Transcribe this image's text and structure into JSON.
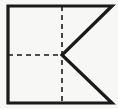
{
  "figure": {
    "type": "line-drawing",
    "canvas": {
      "width": 118,
      "height": 109
    },
    "background_color": "#f7f7f5",
    "stroke_color": "#1a1a1a",
    "dash_color": "#1a1a1a",
    "solid_stroke_width": 3.2,
    "dash_stroke_width": 1.6,
    "dash_pattern": "5,4",
    "geometry": {
      "outline_label": "outer-polygon",
      "outline_points": "8,6 112,6 62,55 112,103 8,103",
      "vertices": [
        {
          "name": "top-left",
          "x": 8,
          "y": 6
        },
        {
          "name": "top-right",
          "x": 112,
          "y": 6
        },
        {
          "name": "center-notch",
          "x": 62,
          "y": 55
        },
        {
          "name": "bottom-right",
          "x": 112,
          "y": 103
        },
        {
          "name": "bottom-left",
          "x": 8,
          "y": 103
        }
      ],
      "vertical_axis": {
        "x": 62,
        "y1": 6,
        "y2": 103
      },
      "horizontal_axis": {
        "y": 55,
        "x1": 8,
        "x2": 62
      }
    }
  }
}
